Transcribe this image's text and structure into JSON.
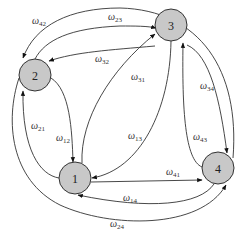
{
  "diagram": {
    "type": "directed-graph",
    "nodes": [
      {
        "id": "1",
        "label": "1",
        "x": 75,
        "y": 178
      },
      {
        "id": "2",
        "label": "2",
        "x": 35,
        "y": 75
      },
      {
        "id": "3",
        "label": "3",
        "x": 171,
        "y": 25
      },
      {
        "id": "4",
        "label": "4",
        "x": 218,
        "y": 168
      }
    ],
    "edges": [
      {
        "from": "4",
        "to": "2",
        "symbol": "ω",
        "sub": "42"
      },
      {
        "from": "2",
        "to": "3",
        "symbol": "ω",
        "sub": "23"
      },
      {
        "from": "3",
        "to": "2",
        "symbol": "ω",
        "sub": "32"
      },
      {
        "from": "3",
        "to": "1",
        "symbol": "ω",
        "sub": "31"
      },
      {
        "from": "3",
        "to": "4",
        "symbol": "ω",
        "sub": "34"
      },
      {
        "from": "1",
        "to": "2",
        "symbol": "ω",
        "sub": "21"
      },
      {
        "from": "2",
        "to": "1",
        "symbol": "ω",
        "sub": "12"
      },
      {
        "from": "1",
        "to": "3",
        "symbol": "ω",
        "sub": "13"
      },
      {
        "from": "4",
        "to": "3",
        "symbol": "ω",
        "sub": "43"
      },
      {
        "from": "1",
        "to": "4",
        "symbol": "ω",
        "sub": "41"
      },
      {
        "from": "4",
        "to": "1",
        "symbol": "ω",
        "sub": "14"
      },
      {
        "from": "2",
        "to": "4",
        "symbol": "ω",
        "sub": "24"
      }
    ]
  }
}
